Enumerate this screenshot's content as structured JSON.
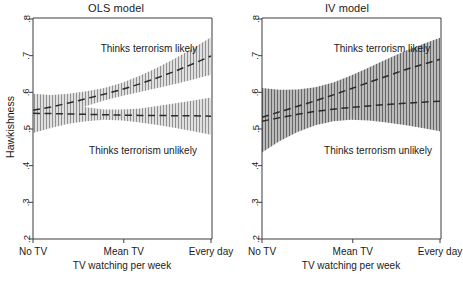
{
  "figure": {
    "width": 463,
    "height": 297,
    "background": "#ffffff"
  },
  "axis": {
    "ylabel": "Hawkishness",
    "xlabel": "TV watching per week",
    "yticks": [
      ".2",
      ".3",
      ".4",
      ".5",
      ".6",
      ".7",
      ".8"
    ],
    "ytick_values": [
      0.2,
      0.3,
      0.4,
      0.5,
      0.6,
      0.7,
      0.8
    ],
    "xticks": [
      "No TV",
      "Mean TV",
      "Every day"
    ],
    "xtick_positions": [
      0.0,
      0.51,
      1.0
    ],
    "ylim": [
      0.2,
      0.8
    ],
    "xlim": [
      0.0,
      1.0
    ],
    "grid": false,
    "line_color": "#3c3c3c"
  },
  "annotations": {
    "likely": "Thinks terrorism likely",
    "unlikely": "Thinks terrorism unlikely"
  },
  "chart_data": {
    "type": "line",
    "xlabel": "TV watching per week",
    "ylabel": "Hawkishness",
    "xlim": [
      0.0,
      1.0
    ],
    "ylim": [
      0.2,
      0.8
    ],
    "grid": false,
    "legend_position": "inline-annotation",
    "xtick_labels": [
      "No TV",
      "Mean TV",
      "Every day"
    ],
    "ytick_labels": [
      ".2",
      ".3",
      ".4",
      ".5",
      ".6",
      ".7",
      ".8"
    ],
    "band_style": "hatched-vertical-lines",
    "line_style": "dashed",
    "panels": [
      {
        "name": "ols",
        "title": "OLS model",
        "series": [
          {
            "name": "Thinks terrorism likely",
            "x": [
              0.0,
              0.1,
              0.2,
              0.3,
              0.4,
              0.5,
              0.6,
              0.7,
              0.8,
              0.9,
              1.0
            ],
            "values": [
              0.551,
              0.56,
              0.571,
              0.583,
              0.595,
              0.608,
              0.623,
              0.64,
              0.658,
              0.678,
              0.699
            ],
            "ci_lower": [
              0.506,
              0.527,
              0.546,
              0.563,
              0.578,
              0.59,
              0.601,
              0.612,
              0.623,
              0.635,
              0.648
            ],
            "ci_upper": [
              0.596,
              0.593,
              0.596,
              0.603,
              0.612,
              0.626,
              0.645,
              0.668,
              0.693,
              0.721,
              0.75
            ]
          },
          {
            "name": "Thinks terrorism unlikely",
            "x": [
              0.0,
              0.1,
              0.2,
              0.3,
              0.4,
              0.5,
              0.6,
              0.7,
              0.8,
              0.9,
              1.0
            ],
            "values": [
              0.543,
              0.542,
              0.541,
              0.54,
              0.539,
              0.538,
              0.537,
              0.537,
              0.536,
              0.536,
              0.535
            ],
            "ci_lower": [
              0.489,
              0.503,
              0.514,
              0.521,
              0.525,
              0.523,
              0.518,
              0.511,
              0.503,
              0.494,
              0.484
            ],
            "ci_upper": [
              0.597,
              0.581,
              0.568,
              0.559,
              0.553,
              0.553,
              0.556,
              0.563,
              0.57,
              0.578,
              0.586
            ]
          }
        ]
      },
      {
        "name": "iv",
        "title": "IV model",
        "series": [
          {
            "name": "Thinks terrorism likely",
            "x": [
              0.0,
              0.1,
              0.2,
              0.3,
              0.4,
              0.5,
              0.6,
              0.7,
              0.8,
              0.9,
              1.0
            ],
            "values": [
              0.532,
              0.547,
              0.562,
              0.577,
              0.593,
              0.61,
              0.627,
              0.644,
              0.661,
              0.676,
              0.69
            ],
            "ci_lower": [
              0.452,
              0.487,
              0.516,
              0.54,
              0.559,
              0.574,
              0.586,
              0.598,
              0.61,
              0.621,
              0.631
            ],
            "ci_upper": [
              0.612,
              0.607,
              0.608,
              0.614,
              0.627,
              0.646,
              0.668,
              0.69,
              0.712,
              0.731,
              0.749
            ]
          },
          {
            "name": "Thinks terrorism unlikely",
            "x": [
              0.0,
              0.1,
              0.2,
              0.3,
              0.4,
              0.5,
              0.6,
              0.7,
              0.8,
              0.9,
              1.0
            ],
            "values": [
              0.521,
              0.531,
              0.54,
              0.548,
              0.554,
              0.559,
              0.563,
              0.567,
              0.57,
              0.573,
              0.576
            ],
            "ci_lower": [
              0.436,
              0.467,
              0.492,
              0.51,
              0.521,
              0.525,
              0.523,
              0.518,
              0.511,
              0.503,
              0.494
            ],
            "ci_upper": [
              0.606,
              0.595,
              0.588,
              0.586,
              0.587,
              0.593,
              0.603,
              0.616,
              0.629,
              0.643,
              0.658
            ]
          }
        ]
      }
    ]
  }
}
